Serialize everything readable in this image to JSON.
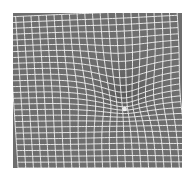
{
  "figure": {
    "background_color": "#6e6e6e",
    "line_color": "#f2f2f2",
    "page_color": "#ffffff",
    "grid": {
      "cols": 22,
      "rows": 26
    },
    "well": {
      "cx": 0.66,
      "cy": 0.52,
      "depth": 0.22,
      "radius": 0.16,
      "highlight_color": "#ffffff"
    }
  }
}
